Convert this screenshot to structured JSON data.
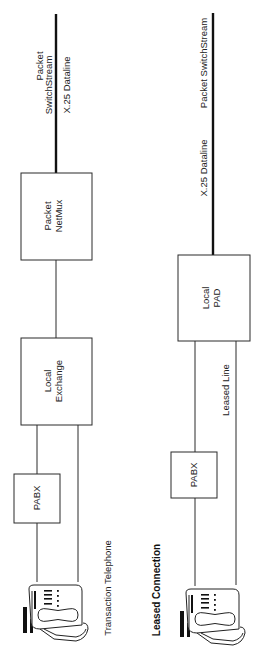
{
  "diagram": {
    "orientation": "rotated-90-ccw",
    "transaction": {
      "caption": "Transaction Telephone",
      "network_label_line1": "Packet",
      "network_label_line2": "SwitchStream",
      "dataline_label": "X.25  Dataline",
      "boxes": {
        "netmux_line1": "Packet",
        "netmux_line2": "NetMux",
        "exchange_line1": "Local",
        "exchange_line2": "Exchange",
        "pabx": "PABX"
      },
      "terminal_icon": "telephone-icon"
    },
    "leased": {
      "caption": "Leased  Connection",
      "network_label": "Packet  SwitchStream",
      "dataline_label": "X.25  Dataline",
      "leased_line_label": "Leased Line",
      "boxes": {
        "pad_line1": "Local",
        "pad_line2": "PAD",
        "pabx": "PABX"
      },
      "terminal_icon": "telephone-icon"
    }
  }
}
